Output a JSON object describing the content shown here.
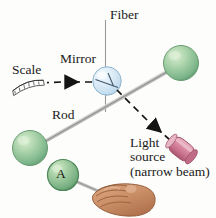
{
  "figure": {
    "width": 216,
    "height": 218,
    "background": "#fdfdfc"
  },
  "labels": {
    "fiber": "Fiber",
    "mirror": "Mirror",
    "scale": "Scale",
    "rod": "Rod",
    "light_source_line1": "Light",
    "light_source_line2": "source",
    "light_source_line3": "(narrow beam)",
    "sphere_a": "A"
  },
  "colors": {
    "sphere_green_light": "#c9e3c0",
    "sphere_green_mid": "#8cc196",
    "sphere_green_dark": "#5f9d6e",
    "sphere_outline": "#4c8257",
    "mirror_blue_light": "#e4f0f8",
    "mirror_blue_mid": "#c4dcef",
    "mirror_outline": "#8fb4cc",
    "light_source_pink": "#d98aa2",
    "light_source_pink_dark": "#b05b77",
    "hand_skin": "#cf9570",
    "hand_skin_shadow": "#b2744f",
    "hand_outline": "#8d5533",
    "rod_gray": "#a8a8a8",
    "fiber_gray": "#9a9a9a",
    "beam_black": "#141414",
    "text_black": "#1a1a1a"
  },
  "elements": {
    "fiber": {
      "description": "vertical thin suspension fiber",
      "x": 105,
      "y_top": 20,
      "y_bottom": 112
    },
    "mirror": {
      "description": "small circular mirror on the fiber",
      "cx": 107,
      "cy": 81,
      "r": 14
    },
    "rod": {
      "description": "horizontal rod joining the two small spheres, drawn in perspective",
      "x1": 30,
      "y1": 148,
      "x2": 181,
      "y2": 63
    },
    "sphere_top_right": {
      "cx": 181,
      "cy": 63,
      "r": 17
    },
    "sphere_bottom_left": {
      "cx": 30,
      "cy": 148,
      "r": 17
    },
    "sphere_a": {
      "cx": 63,
      "cy": 175,
      "r": 15
    },
    "light_source": {
      "description": "pink cylindrical narrow-beam light source",
      "cx": 181,
      "cy": 149,
      "length": 34,
      "angle_deg": 55
    },
    "beam_incident": {
      "description": "dashed beam from light source up-left to mirror",
      "x1": 172,
      "y1": 141,
      "x2": 116,
      "y2": 88
    },
    "beam_reflected": {
      "description": "dashed beam from mirror left to the scale, arrow points left",
      "x1": 93,
      "y1": 82,
      "x2": 48,
      "y2": 82
    },
    "scale_strip": {
      "description": "small curved white scale/ruler with tick marks",
      "cx": 28,
      "cy": 85
    },
    "hand": {
      "description": "hand gripping the rod near sphere A",
      "cx": 118,
      "cy": 196
    }
  }
}
